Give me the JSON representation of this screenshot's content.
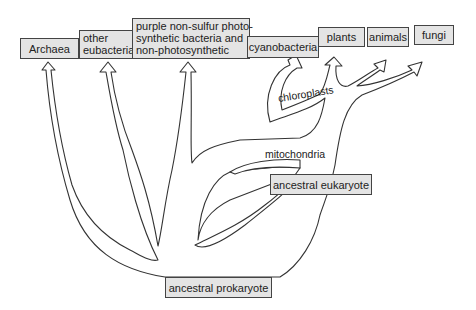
{
  "diagram": {
    "type": "phylogenetic-tree",
    "leaves": [
      {
        "id": "archaea",
        "label": "Archaea"
      },
      {
        "id": "other-eubacteria",
        "line1": "other",
        "line2": "eubacteria"
      },
      {
        "id": "purple",
        "line1": "purple non-sulfur photo-",
        "line2": "synthetic bacteria and",
        "line3": "non-photosynthetic"
      },
      {
        "id": "cyanobacteria",
        "label": "cyanobacteria"
      },
      {
        "id": "plants",
        "label": "plants"
      },
      {
        "id": "animals",
        "label": "animals"
      },
      {
        "id": "fungi",
        "label": "fungi"
      }
    ],
    "internal_nodes": {
      "ancestral_prokaryote": "ancestral prokaryote",
      "ancestral_eukaryote": "ancestral eukaryote"
    },
    "endosymbiosis_labels": {
      "chloroplasts": "chloroplasts",
      "mitochondria": "mitochondria"
    },
    "colors": {
      "box_fill": "#e4e4e4",
      "box_border": "#444444",
      "stroke": "#333333"
    }
  }
}
